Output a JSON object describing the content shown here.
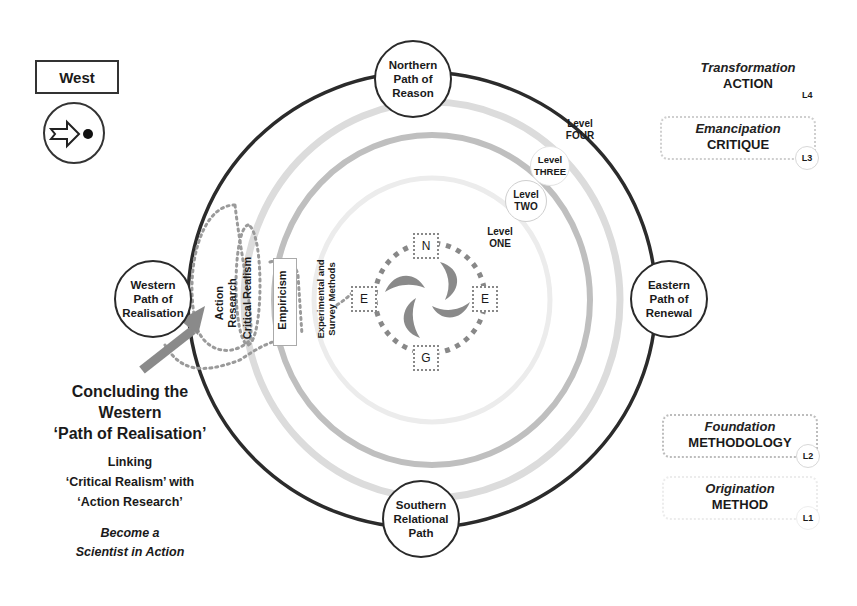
{
  "legend": {
    "direction_label": "West",
    "direction_icon": "arrow-into-dot-icon"
  },
  "paths": {
    "north": "Northern\nPath of\nReason",
    "south": "Southern\nRelational\nPath",
    "west": "Western\nPath of\nRealisation",
    "east": "Eastern\nPath of\nRenewal"
  },
  "levels": {
    "four": "Level\nFOUR",
    "three": "Level\nTHREE",
    "two": "Level\nTWO",
    "one": "Level\nONE"
  },
  "western_methods": [
    {
      "label": "Action\nResearch"
    },
    {
      "label": "Critical Realism"
    },
    {
      "label": "Empiricism"
    },
    {
      "label": "Experimental and\nSurvey Methods"
    }
  ],
  "compass": {
    "north": "N",
    "east": "E",
    "west": "E",
    "south": "G"
  },
  "stages": [
    {
      "title": "Transformation",
      "subtitle": "ACTION",
      "badge": "L4"
    },
    {
      "title": "Emancipation",
      "subtitle": "CRITIQUE",
      "badge": "L3"
    },
    {
      "title": "Foundation",
      "subtitle": "METHODOLOGY",
      "badge": "L2"
    },
    {
      "title": "Origination",
      "subtitle": "METHOD",
      "badge": "L1"
    }
  ],
  "caption": {
    "heading_line1": "Concluding the",
    "heading_line2": "Western",
    "heading_line3": "‘Path of Realisation’",
    "link_line1": "Linking",
    "link_line2": "‘Critical Realism’ with",
    "link_line3": "‘Action Research’",
    "tag_line1": "Become a",
    "tag_line2": "Scientist in Action"
  },
  "colors": {
    "outer_ring": "#2b2b2b",
    "level_ring_light": "#d9d9d9",
    "level_ring_mid": "#bdbdbd",
    "arrow_gray": "#8a8a8a",
    "dotted_gray": "#9a9a9a"
  }
}
